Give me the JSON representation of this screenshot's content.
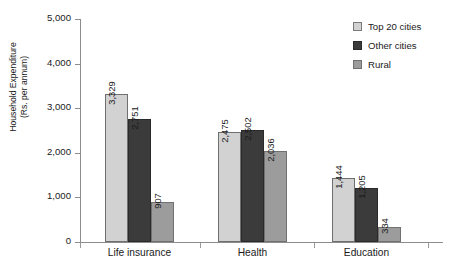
{
  "chart_data": {
    "type": "bar",
    "title": "",
    "xlabel": "",
    "ylabel": "Household Expenditure (Rs. per annum)",
    "ylabel_line1": "Household Expenditure",
    "ylabel_line2": "(Rs. per annum)",
    "categories": [
      "Life insurance",
      "Health",
      "Education"
    ],
    "series": [
      {
        "name": "Top 20 cities",
        "color": "#d2d2d2",
        "values": [
          3329,
          2751,
          907
        ]
      },
      {
        "name": "Other cities",
        "color": "#3b3b3b",
        "values": [
          2475,
          2502,
          2036
        ]
      },
      {
        "name": "Rural",
        "color": "#9c9c9c",
        "values": [
          1444,
          1205,
          334
        ]
      }
    ],
    "grouped_values": [
      {
        "category": "Life insurance",
        "values": [
          3329,
          2751,
          907
        ],
        "labels": [
          "3,329",
          "2,751",
          "907"
        ]
      },
      {
        "category": "Health",
        "values": [
          2475,
          2502,
          2036
        ],
        "labels": [
          "2,475",
          "2,502",
          "2,036"
        ]
      },
      {
        "category": "Education",
        "values": [
          1444,
          1205,
          334
        ],
        "labels": [
          "1,444",
          "1,205",
          "334"
        ]
      }
    ],
    "ylim": [
      0,
      5000
    ],
    "yticks": [
      0,
      1000,
      2000,
      3000,
      4000,
      5000
    ],
    "ytick_labels": [
      "0",
      "1,000",
      "2,000",
      "3,000",
      "4,000",
      "5,000"
    ],
    "grid": false,
    "legend_position": "top-right"
  },
  "legend": {
    "items": [
      {
        "label": "Top 20 cities"
      },
      {
        "label": "Other cities"
      },
      {
        "label": "Rural"
      }
    ]
  }
}
